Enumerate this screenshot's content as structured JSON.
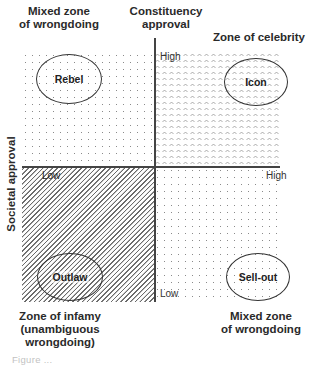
{
  "diagram": {
    "type": "quadrant",
    "axes": {
      "vertical": {
        "title": "Constituency approval",
        "title_lines": [
          "Constituency",
          "approval"
        ],
        "high": "High",
        "low": "Low"
      },
      "horizontal": {
        "title": "Societal approval",
        "high": "High",
        "low": "Low"
      }
    },
    "zones": {
      "top_left": {
        "title_lines": [
          "Mixed zone",
          "of wrongdoing"
        ],
        "archetype": "Rebel",
        "pattern": "dots"
      },
      "top_right": {
        "title_lines": [
          "Zone of celebrity"
        ],
        "archetype": "Icon",
        "pattern": "chevrons"
      },
      "bottom_left": {
        "title_lines": [
          "Zone of infamy",
          "(unambiguous",
          "wrongdoing)"
        ],
        "archetype": "Outlaw",
        "pattern": "diagonal-hatch"
      },
      "bottom_right": {
        "title_lines": [
          "Mixed zone",
          "of wrongdoing"
        ],
        "archetype": "Sell-out",
        "pattern": "dots"
      }
    },
    "caption_fragment": "Figure ..."
  }
}
